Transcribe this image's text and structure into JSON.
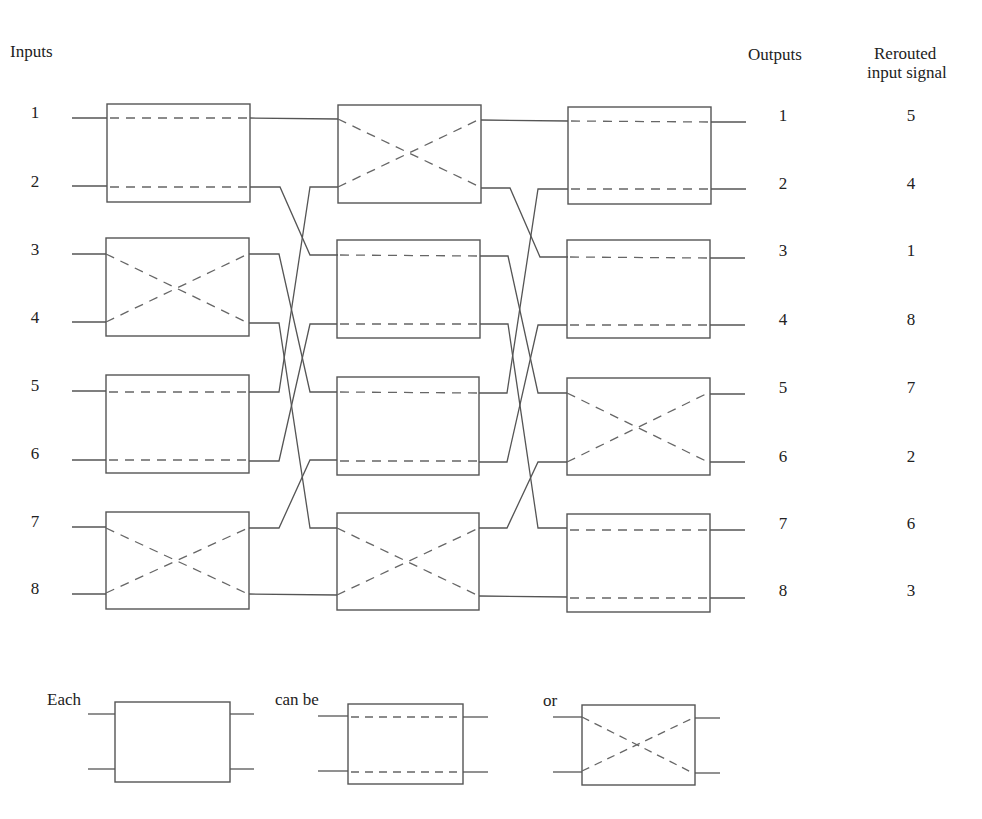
{
  "headers": {
    "inputs": "Inputs",
    "outputs": "Outputs",
    "rerouted_line1": "Rerouted",
    "rerouted_line2": "input signal"
  },
  "inputs": [
    "1",
    "2",
    "3",
    "4",
    "5",
    "6",
    "7",
    "8"
  ],
  "outputs": [
    "1",
    "2",
    "3",
    "4",
    "5",
    "6",
    "7",
    "8"
  ],
  "rerouted": [
    "5",
    "4",
    "1",
    "8",
    "7",
    "2",
    "6",
    "3"
  ],
  "stages": [
    {
      "name": "stage-1",
      "switches": [
        "straight",
        "cross",
        "straight",
        "cross"
      ]
    },
    {
      "name": "stage-2",
      "switches": [
        "cross",
        "straight",
        "straight",
        "cross"
      ]
    },
    {
      "name": "stage-3",
      "switches": [
        "straight",
        "straight",
        "cross",
        "straight"
      ]
    }
  ],
  "interstage_shuffle": {
    "1": 1,
    "2": 3,
    "3": 5,
    "4": 7,
    "5": 2,
    "6": 4,
    "7": 6,
    "8": 8
  },
  "legend": {
    "each": "Each",
    "can_be": "can be",
    "or": "or",
    "states": [
      "unset",
      "straight",
      "cross"
    ]
  },
  "colors": {
    "line": "#555555",
    "dash": "#666666",
    "text": "#222222"
  }
}
